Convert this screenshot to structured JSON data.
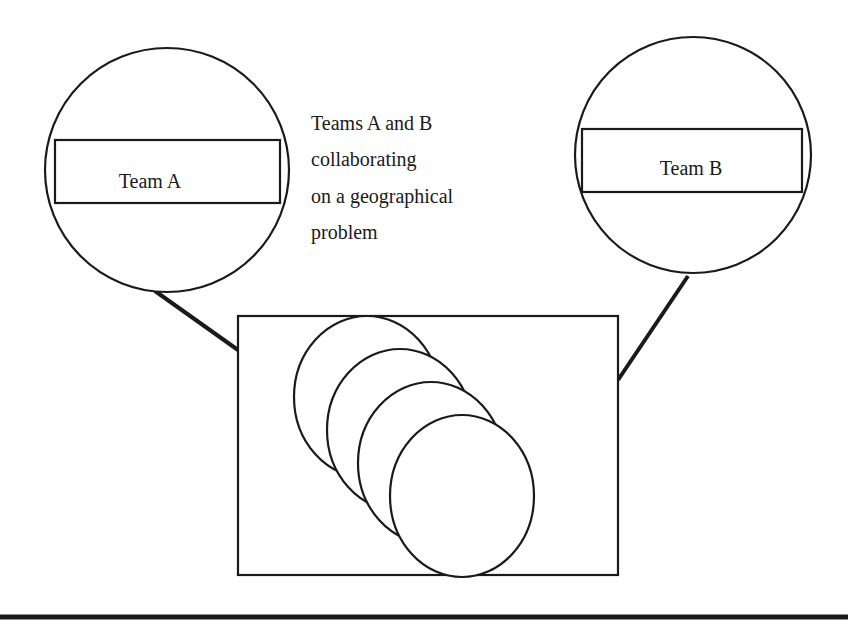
{
  "diagram": {
    "caption_lines": [
      "Teams A and B",
      "collaborating",
      "on a geographical",
      "problem"
    ],
    "team_a": {
      "label": "Team A"
    },
    "team_b": {
      "label": "Team B"
    },
    "shared_workspace": {
      "overlapping_circles": 4
    },
    "colors": {
      "stroke": "#1a1a1a",
      "background": "#ffffff"
    }
  }
}
